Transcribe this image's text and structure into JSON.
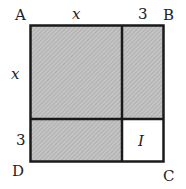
{
  "diagram": {
    "vertices": {
      "A": "A",
      "B": "B",
      "C": "C",
      "D": "D"
    },
    "side_labels": {
      "top_left": "x",
      "top_right": "3",
      "left_top": "x",
      "left_bottom": "3"
    },
    "region_label": "I",
    "colors": {
      "shaded": "#b8b8b8",
      "line": "#1a1a1a",
      "unshaded": "#ffffff"
    }
  }
}
